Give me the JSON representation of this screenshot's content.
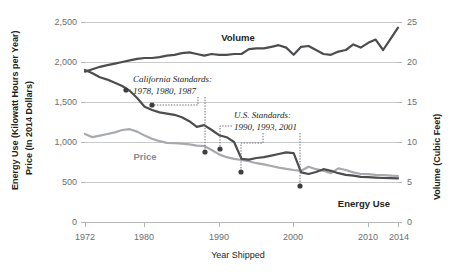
{
  "chart_data": {
    "type": "line",
    "title": "",
    "xlabel": "Year Shipped",
    "ylabel_left": "Energy Use (Kilowatt Hours per Year)  Price (In 2014 Dollars)",
    "ylabel_left_part1_bold": "Energy Use",
    "ylabel_left_part1_rest": " (Kilowatt Hours per Year)",
    "ylabel_left_part2_bold": "Price",
    "ylabel_left_part2_rest": " (In 2014 Dollars)",
    "ylabel_right_bold": "Volume",
    "ylabel_right_rest": " (Cubic Feet)",
    "xlim": [
      1972,
      2014
    ],
    "ylim_left": [
      0,
      2500
    ],
    "ylim_right": [
      0,
      25
    ],
    "grid": true,
    "legend_position": "inline-labels",
    "x_ticks": [
      "1972",
      "1980",
      "1990",
      "2000",
      "2010",
      "2014"
    ],
    "x_tick_values": [
      1972,
      1980,
      1990,
      2000,
      2010,
      2014
    ],
    "y_ticks_left": [
      "0",
      "500",
      "1,000",
      "1,500",
      "2,000",
      "2,500"
    ],
    "y_tick_values_left": [
      0,
      500,
      1000,
      1500,
      2000,
      2500
    ],
    "y_ticks_right": [
      "0",
      "5",
      "10",
      "15",
      "20",
      "25"
    ],
    "y_tick_values_right": [
      0,
      5,
      10,
      15,
      20,
      25
    ],
    "series": [
      {
        "name": "Energy Use",
        "axis": "left",
        "units": "Kilowatt Hours per Year",
        "color": "#4d4d4f",
        "x": [
          1972,
          1973,
          1974,
          1975,
          1976,
          1977,
          1978,
          1979,
          1980,
          1981,
          1982,
          1983,
          1984,
          1985,
          1986,
          1987,
          1988,
          1989,
          1990,
          1991,
          1992,
          1993,
          1994,
          1995,
          1996,
          1997,
          1998,
          1999,
          2000,
          2001,
          2002,
          2003,
          2004,
          2005,
          2006,
          2007,
          2008,
          2009,
          2010,
          2011,
          2012,
          2013,
          2014
        ],
        "values": [
          1900,
          1860,
          1810,
          1780,
          1740,
          1700,
          1640,
          1550,
          1440,
          1400,
          1370,
          1355,
          1340,
          1310,
          1260,
          1190,
          1210,
          1150,
          1085,
          1060,
          1000,
          790,
          780,
          800,
          810,
          830,
          850,
          870,
          860,
          620,
          600,
          625,
          660,
          640,
          610,
          590,
          580,
          565,
          560,
          555,
          550,
          548,
          545
        ]
      },
      {
        "name": "Price",
        "axis": "left",
        "units": "In 2014 Dollars",
        "color": "#a7a9ac",
        "x": [
          1972,
          1973,
          1974,
          1975,
          1976,
          1977,
          1978,
          1979,
          1980,
          1981,
          1982,
          1983,
          1984,
          1985,
          1986,
          1987,
          1988,
          1989,
          1990,
          1991,
          1992,
          1993,
          1994,
          1995,
          1996,
          1997,
          1998,
          1999,
          2000,
          2001,
          2002,
          2003,
          2004,
          2005,
          2006,
          2007,
          2008,
          2009,
          2010,
          2011,
          2012,
          2013,
          2014
        ],
        "values": [
          1100,
          1060,
          1080,
          1100,
          1120,
          1150,
          1160,
          1130,
          1080,
          1040,
          1010,
          990,
          985,
          980,
          970,
          955,
          950,
          900,
          845,
          810,
          790,
          775,
          760,
          735,
          720,
          700,
          680,
          665,
          650,
          640,
          690,
          660,
          640,
          610,
          670,
          650,
          620,
          600,
          598,
          590,
          585,
          580,
          575
        ]
      },
      {
        "name": "Volume",
        "axis": "right",
        "units": "Cubic Feet",
        "color": "#4d4d4f",
        "x": [
          1972,
          1973,
          1974,
          1975,
          1976,
          1977,
          1978,
          1979,
          1980,
          1981,
          1982,
          1983,
          1984,
          1985,
          1986,
          1987,
          1988,
          1989,
          1990,
          1991,
          1992,
          1993,
          1994,
          1995,
          1996,
          1997,
          1998,
          1999,
          2000,
          2001,
          2002,
          2003,
          2004,
          2005,
          2006,
          2007,
          2008,
          2009,
          2010,
          2011,
          2012,
          2013,
          2014
        ],
        "values": [
          18.8,
          19.1,
          19.4,
          19.6,
          19.8,
          20.0,
          20.2,
          20.4,
          20.5,
          20.5,
          20.6,
          20.8,
          20.9,
          21.1,
          21.2,
          21.0,
          20.8,
          21.0,
          20.9,
          20.9,
          21.0,
          21.0,
          21.6,
          21.7,
          21.7,
          21.9,
          22.1,
          21.8,
          20.9,
          21.9,
          22.0,
          21.5,
          21.0,
          20.9,
          21.3,
          21.5,
          22.2,
          21.8,
          22.4,
          22.8,
          21.5,
          22.9,
          24.3
        ]
      }
    ],
    "annotations": [
      {
        "id": "california-standards",
        "title": "California Standards:",
        "years_text": "1978, 1980, 1987",
        "years": [
          1978,
          1980,
          1987
        ]
      },
      {
        "id": "us-standards",
        "title": "U.S. Standards:",
        "years_text": "1990, 1993, 2001",
        "years": [
          1990,
          1993,
          2001
        ]
      }
    ],
    "series_labels": [
      {
        "text": "Volume",
        "series": "Volume"
      },
      {
        "text": "Price",
        "series": "Price"
      },
      {
        "text": "Energy Use",
        "series": "Energy Use"
      }
    ]
  }
}
